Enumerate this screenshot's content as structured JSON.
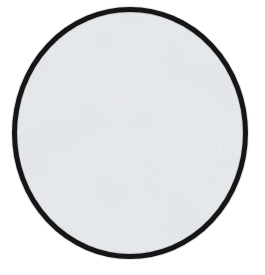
{
  "image": {
    "object": "textured-disc",
    "colors": {
      "background": "#ffffff",
      "disc_fill": "#eff1f4",
      "disc_grain": "#8a929a",
      "outline": "#161616",
      "outline_halo": "#9aa0a6"
    }
  }
}
